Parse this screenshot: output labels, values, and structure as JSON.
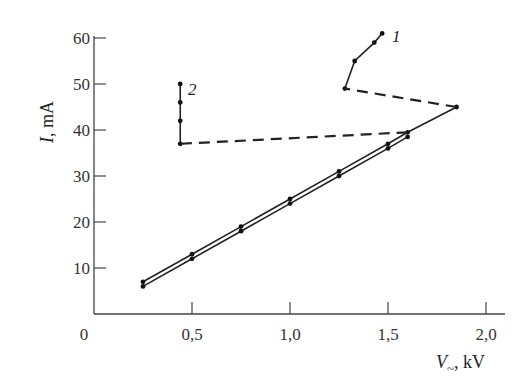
{
  "chart_data": {
    "type": "line",
    "title": "",
    "xlabel": "V~, kV",
    "ylabel": "I, mA",
    "xlim": [
      0,
      2.1
    ],
    "ylim": [
      0,
      62
    ],
    "x_ticks": [
      "0",
      "0,5",
      "1,0",
      "1,5",
      "2,0"
    ],
    "x_tick_values": [
      0,
      0.5,
      1.0,
      1.5,
      2.0
    ],
    "y_ticks": [
      "10",
      "20",
      "30",
      "40",
      "50",
      "60"
    ],
    "y_tick_values": [
      10,
      20,
      30,
      40,
      50,
      60
    ],
    "grid": false,
    "legend": "none (curves labelled inline '1' and '2')",
    "series": [
      {
        "name": "linear-upper",
        "style": "solid",
        "x": [
          0.25,
          0.5,
          0.75,
          1.0,
          1.25,
          1.5,
          1.6,
          1.85
        ],
        "y": [
          7,
          13,
          19,
          25,
          31,
          37,
          39.5,
          45
        ]
      },
      {
        "name": "linear-lower",
        "style": "solid",
        "x": [
          0.25,
          0.5,
          0.75,
          1.0,
          1.25,
          1.5,
          1.6
        ],
        "y": [
          6,
          12,
          18,
          24,
          30,
          36,
          38.5
        ]
      },
      {
        "name": "1",
        "style": "solid",
        "x": [
          1.28,
          1.33,
          1.43,
          1.47
        ],
        "y": [
          49,
          55,
          59,
          61
        ]
      },
      {
        "name": "2",
        "style": "solid",
        "x": [
          0.44,
          0.44,
          0.44,
          0.44
        ],
        "y": [
          37,
          42,
          46,
          50
        ]
      },
      {
        "name": "transition-1",
        "style": "dashed",
        "x": [
          1.85,
          1.28
        ],
        "y": [
          45,
          49
        ]
      },
      {
        "name": "transition-2",
        "style": "dashed",
        "x": [
          1.6,
          0.44
        ],
        "y": [
          39.5,
          37
        ]
      }
    ],
    "annotations": [
      {
        "text": "1",
        "x": 1.52,
        "y": 60.5
      },
      {
        "text": "2",
        "x": 0.48,
        "y": 49
      }
    ]
  },
  "labels": {
    "y_axis_title_italic": "I",
    "y_axis_title_rest": ", mA",
    "x_axis_title_italic": "V",
    "x_axis_title_sub": "~",
    "x_axis_title_rest": ", kV",
    "origin": "0",
    "curve_1": "1",
    "curve_2": "2"
  }
}
